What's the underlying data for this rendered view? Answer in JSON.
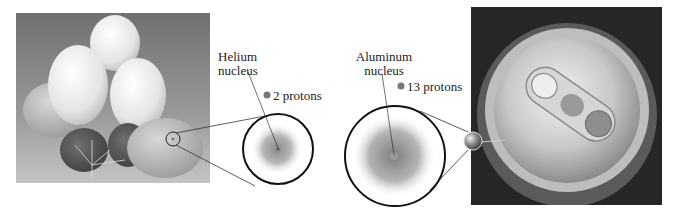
{
  "figure": {
    "left_photo": {
      "subject": "helium balloons",
      "icon": "balloons-photo"
    },
    "right_photo": {
      "subject": "aluminum can top",
      "icon": "can-photo"
    },
    "helium": {
      "label_line1": "Helium",
      "label_line2": "nucleus",
      "protons_text": "2 protons",
      "proton_count": 2
    },
    "aluminum": {
      "label_line1": "Aluminum",
      "label_line2": "nucleus",
      "protons_text": "13 protons",
      "proton_count": 13
    },
    "colors": {
      "sky": "#8a8a8a",
      "can_bg": "#2a2a2a",
      "circle_stroke": "#111111",
      "nucleus_cloud": "#9a9a9a",
      "proton_dot": "#777777"
    }
  }
}
